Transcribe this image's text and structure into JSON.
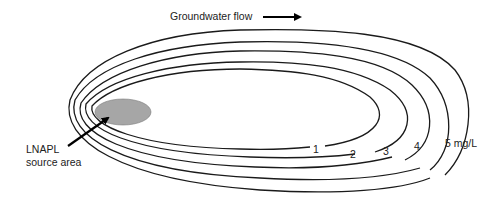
{
  "diagram": {
    "flow_label": "Groundwater flow",
    "source_label_line1": "LNAPL",
    "source_label_line2": "source area",
    "source_color": "#a6a6a6",
    "contours": [
      {
        "label": "1",
        "value": 1,
        "unit": "mg/L"
      },
      {
        "label": "2",
        "value": 2,
        "unit": "mg/L"
      },
      {
        "label": "3",
        "value": 3,
        "unit": "mg/L"
      },
      {
        "label": "4",
        "value": 4,
        "unit": "mg/L"
      },
      {
        "label": "5 mg/L",
        "value": 5,
        "unit": "mg/L"
      }
    ]
  }
}
